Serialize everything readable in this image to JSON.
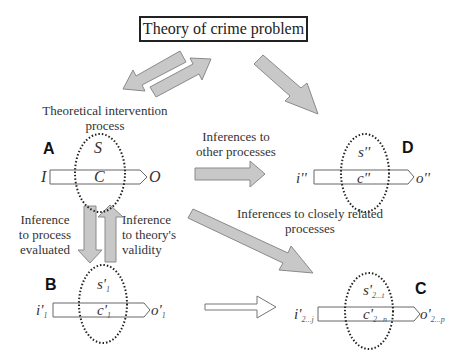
{
  "title": "Theory of crime problem",
  "labels": {
    "theoretical_intervention_line1": "Theoretical intervention",
    "theoretical_intervention_line2": "process",
    "inferences_other_line1": "Inferences to",
    "inferences_other_line2": "other  processes",
    "inference_process_line1": "Inference",
    "inference_process_line2": "to process",
    "inference_process_line3": "evaluated",
    "inference_theory_line1": "Inference",
    "inference_theory_line2": "to theory's",
    "inference_theory_line3": "validity",
    "inferences_related_line1": "Inferences to closely related",
    "inferences_related_line2": "processes"
  },
  "panels": {
    "A": {
      "letter": "A",
      "input": "I",
      "s": "S",
      "c": "C",
      "output": "O"
    },
    "B": {
      "letter": "B",
      "input": "i'",
      "input_sub": "1",
      "s": "s'",
      "s_sub": "1",
      "c": "c'",
      "c_sub": "1",
      "output": "o'",
      "output_sub": "1"
    },
    "C": {
      "letter": "C",
      "input": "i'",
      "input_sub": "2...j",
      "s": "s'",
      "s_sub": "2...t",
      "c": "c'",
      "c_sub": "2...n",
      "output": "o'",
      "output_sub": "2...p"
    },
    "D": {
      "letter": "D",
      "input": "i''",
      "s": "s''",
      "c": "c''",
      "output": "o''"
    }
  },
  "colors": {
    "arrow_fill": "#c8c8c8",
    "arrow_stroke": "#8a8a8a",
    "outline": "#555555",
    "dotted": "#222222"
  }
}
